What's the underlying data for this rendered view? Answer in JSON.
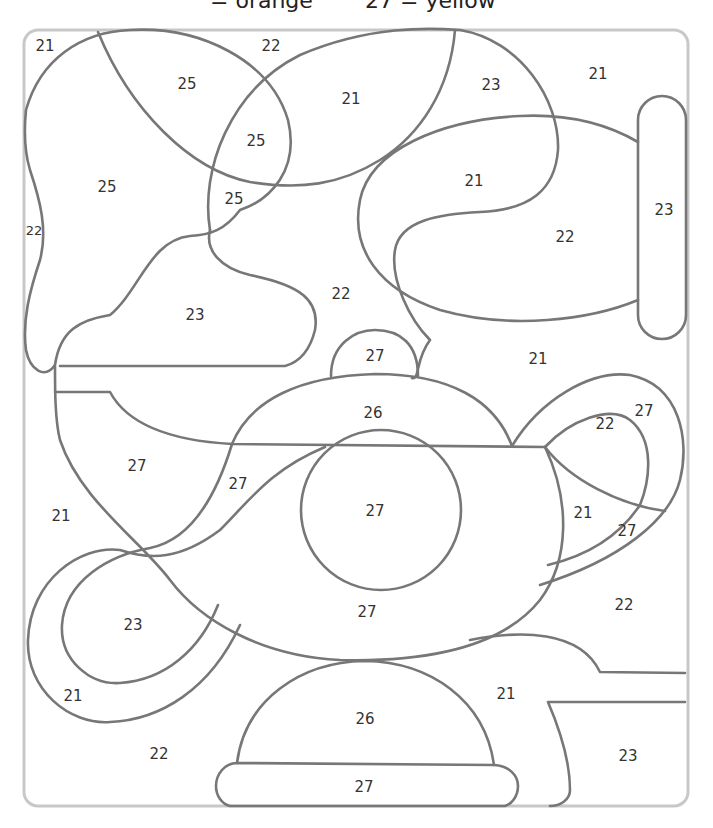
{
  "legend": {
    "partial_text_left": "= orange",
    "partial_text_right": "27 = yellow",
    "entries": [
      {
        "number": "",
        "color_name": "orange"
      },
      {
        "number": "27",
        "color_name": "yellow"
      }
    ]
  },
  "worksheet": {
    "type": "color-by-number",
    "subject": "teapot",
    "region_numbers": [
      {
        "id": "r1",
        "label": "21",
        "x": 45,
        "y": 46
      },
      {
        "id": "r2",
        "label": "22",
        "x": 271,
        "y": 46
      },
      {
        "id": "r3",
        "label": "25",
        "x": 187,
        "y": 84
      },
      {
        "id": "r4",
        "label": "21",
        "x": 351,
        "y": 99
      },
      {
        "id": "r5",
        "label": "23",
        "x": 491,
        "y": 85
      },
      {
        "id": "r6",
        "label": "21",
        "x": 598,
        "y": 74
      },
      {
        "id": "r7",
        "label": "25",
        "x": 256,
        "y": 141
      },
      {
        "id": "r8",
        "label": "25",
        "x": 107,
        "y": 187
      },
      {
        "id": "r9",
        "label": "25",
        "x": 234,
        "y": 199
      },
      {
        "id": "r10",
        "label": "21",
        "x": 474,
        "y": 181
      },
      {
        "id": "r11",
        "label": "23",
        "x": 664,
        "y": 210
      },
      {
        "id": "r12",
        "label": "22",
        "x": 34,
        "y": 231
      },
      {
        "id": "r13",
        "label": "22",
        "x": 565,
        "y": 237
      },
      {
        "id": "r14",
        "label": "22",
        "x": 341,
        "y": 294
      },
      {
        "id": "r15",
        "label": "23",
        "x": 195,
        "y": 315
      },
      {
        "id": "r16",
        "label": "27",
        "x": 375,
        "y": 356
      },
      {
        "id": "r17",
        "label": "21",
        "x": 538,
        "y": 359
      },
      {
        "id": "r18",
        "label": "26",
        "x": 373,
        "y": 413
      },
      {
        "id": "r19",
        "label": "27",
        "x": 644,
        "y": 411
      },
      {
        "id": "r20",
        "label": "22",
        "x": 605,
        "y": 424
      },
      {
        "id": "r21",
        "label": "27",
        "x": 137,
        "y": 466
      },
      {
        "id": "r22",
        "label": "27",
        "x": 238,
        "y": 484
      },
      {
        "id": "r23",
        "label": "21",
        "x": 61,
        "y": 516
      },
      {
        "id": "r24",
        "label": "27",
        "x": 375,
        "y": 511
      },
      {
        "id": "r25",
        "label": "21",
        "x": 583,
        "y": 513
      },
      {
        "id": "r26",
        "label": "27",
        "x": 627,
        "y": 531
      },
      {
        "id": "r27",
        "label": "22",
        "x": 624,
        "y": 605
      },
      {
        "id": "r28",
        "label": "27",
        "x": 367,
        "y": 612
      },
      {
        "id": "r29",
        "label": "23",
        "x": 133,
        "y": 625
      },
      {
        "id": "r30",
        "label": "21",
        "x": 73,
        "y": 696
      },
      {
        "id": "r31",
        "label": "21",
        "x": 506,
        "y": 694
      },
      {
        "id": "r32",
        "label": "26",
        "x": 365,
        "y": 719
      },
      {
        "id": "r33",
        "label": "22",
        "x": 159,
        "y": 754
      },
      {
        "id": "r34",
        "label": "23",
        "x": 628,
        "y": 756
      },
      {
        "id": "r35",
        "label": "27",
        "x": 364,
        "y": 787
      }
    ]
  },
  "colors": {
    "outline": "#777777",
    "frame": "#c8c8c8",
    "number_text": "#333333",
    "background": "#ffffff"
  }
}
